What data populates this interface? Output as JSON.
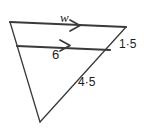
{
  "figure": {
    "name": "triangle-with-parallel-segment",
    "background_color": "#ffffff",
    "stroke_color": "#3a3a3a",
    "labels": {
      "top_side": "w",
      "mid_segment": "6",
      "upper_right_side": "1·5",
      "lower_right_side": "4·5"
    },
    "markers": {
      "top_side_arrow": "single-arrow-right",
      "mid_segment_arrow": "single-arrow-right"
    },
    "vertices": {
      "top_left": [
        10,
        22
      ],
      "top_right": [
        126,
        27
      ],
      "bottom_apex": [
        40,
        122
      ],
      "mid_left": [
        17,
        46
      ],
      "mid_right": [
        110,
        50
      ]
    }
  }
}
